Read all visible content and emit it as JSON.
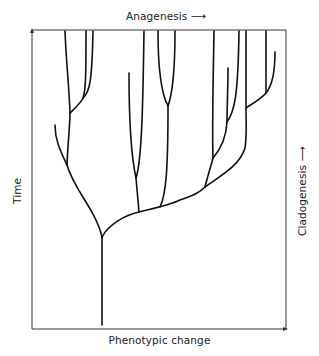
{
  "diagram": {
    "type": "phylogenetic-tree",
    "labels": {
      "top": "Anagenesis",
      "bottom": "Phenotypic change",
      "left": "Time",
      "right": "Cladogenesis"
    },
    "arrows": {
      "top": "→",
      "right": "→"
    },
    "colors": {
      "line": "#111111",
      "frame": "#333333",
      "background": "#ffffff"
    }
  }
}
